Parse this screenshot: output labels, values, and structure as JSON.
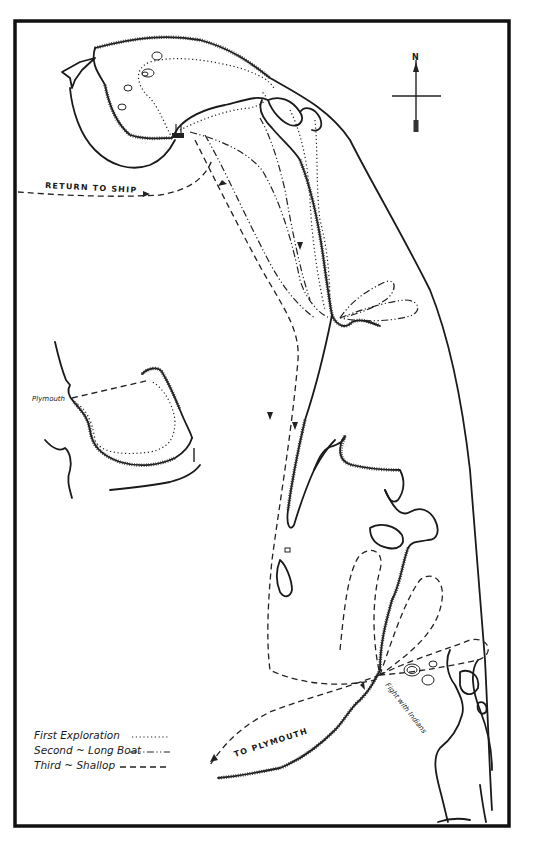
{
  "map": {
    "compass": {
      "north_label": "N"
    },
    "labels": {
      "return_to_ship": "RETURN TO SHIP",
      "to_plymouth": "TO PLYMOUTH",
      "plymouth": "Plymouth",
      "fight_with_indians": "Fight with Indians"
    },
    "legend": {
      "items": [
        {
          "label": "First Exploration",
          "style": "dotted"
        },
        {
          "label": "Second ~ Long Boat",
          "style": "dash-dot"
        },
        {
          "label": "Third ~ Shallop",
          "style": "dashed"
        }
      ]
    },
    "colors": {
      "ink": "#1a1a1a",
      "paper": "#ffffff"
    }
  }
}
